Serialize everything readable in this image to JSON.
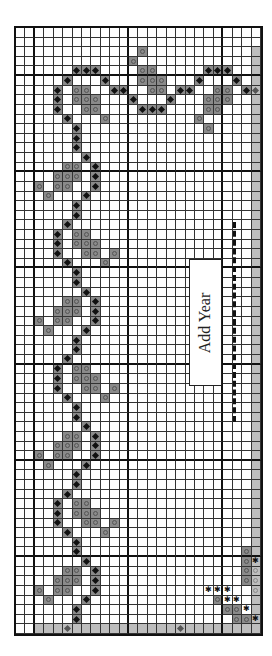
{
  "grid": {
    "cols": 26,
    "rows": 63,
    "thick_col_every": 10,
    "thick_col_offset": 2,
    "thick_row_every": 10,
    "thick_row_offset": 5
  },
  "colors": {
    "mark": "#8a8a8a",
    "shade": "#bdbdbd",
    "line": "#333333"
  },
  "shaded": {
    "right_col": 25,
    "right_from_row": 2,
    "bottom_row": 62,
    "bottom_from_col": 2
  },
  "label": {
    "text": "Add Year"
  },
  "marks": [
    [
      2,
      13,
      "O"
    ],
    [
      3,
      12,
      "O"
    ],
    [
      4,
      6,
      "D"
    ],
    [
      4,
      7,
      "D"
    ],
    [
      4,
      8,
      "D"
    ],
    [
      4,
      13,
      "O"
    ],
    [
      4,
      14,
      "O"
    ],
    [
      4,
      20,
      "D"
    ],
    [
      4,
      21,
      "D"
    ],
    [
      4,
      22,
      "D"
    ],
    [
      5,
      5,
      "D"
    ],
    [
      5,
      9,
      "D"
    ],
    [
      5,
      13,
      "O"
    ],
    [
      5,
      14,
      "O"
    ],
    [
      5,
      15,
      "O"
    ],
    [
      5,
      19,
      "D"
    ],
    [
      5,
      23,
      "D"
    ],
    [
      6,
      4,
      "D"
    ],
    [
      6,
      6,
      "O"
    ],
    [
      6,
      7,
      "O"
    ],
    [
      6,
      10,
      "D"
    ],
    [
      6,
      11,
      "D"
    ],
    [
      6,
      14,
      "O"
    ],
    [
      6,
      15,
      "O"
    ],
    [
      6,
      17,
      "D"
    ],
    [
      6,
      18,
      "D"
    ],
    [
      6,
      21,
      "O"
    ],
    [
      6,
      22,
      "O"
    ],
    [
      6,
      24,
      "D"
    ],
    [
      6,
      25,
      "d"
    ],
    [
      7,
      4,
      "D"
    ],
    [
      7,
      6,
      "O"
    ],
    [
      7,
      7,
      "O"
    ],
    [
      7,
      8,
      "O"
    ],
    [
      7,
      12,
      "D"
    ],
    [
      7,
      16,
      "D"
    ],
    [
      7,
      20,
      "O"
    ],
    [
      7,
      21,
      "O"
    ],
    [
      7,
      22,
      "O"
    ],
    [
      8,
      4,
      "D"
    ],
    [
      8,
      7,
      "O"
    ],
    [
      8,
      8,
      "O"
    ],
    [
      8,
      13,
      "D"
    ],
    [
      8,
      14,
      "D"
    ],
    [
      8,
      15,
      "D"
    ],
    [
      8,
      20,
      "O"
    ],
    [
      8,
      21,
      "O"
    ],
    [
      9,
      5,
      "D"
    ],
    [
      9,
      9,
      "O"
    ],
    [
      9,
      19,
      "O"
    ],
    [
      10,
      6,
      "D"
    ],
    [
      10,
      20,
      "O"
    ],
    [
      11,
      6,
      "D"
    ],
    [
      12,
      6,
      "D"
    ],
    [
      13,
      7,
      "D"
    ],
    [
      14,
      5,
      "O"
    ],
    [
      14,
      6,
      "O"
    ],
    [
      14,
      8,
      "D"
    ],
    [
      15,
      4,
      "O"
    ],
    [
      15,
      5,
      "O"
    ],
    [
      15,
      6,
      "O"
    ],
    [
      15,
      8,
      "D"
    ],
    [
      16,
      2,
      "O"
    ],
    [
      16,
      4,
      "O"
    ],
    [
      16,
      5,
      "O"
    ],
    [
      16,
      8,
      "D"
    ],
    [
      17,
      3,
      "O"
    ],
    [
      17,
      7,
      "D"
    ],
    [
      18,
      6,
      "D"
    ],
    [
      19,
      6,
      "D"
    ],
    [
      20,
      5,
      "D"
    ],
    [
      21,
      4,
      "D"
    ],
    [
      21,
      6,
      "O"
    ],
    [
      21,
      7,
      "O"
    ],
    [
      22,
      4,
      "D"
    ],
    [
      22,
      6,
      "O"
    ],
    [
      22,
      7,
      "O"
    ],
    [
      22,
      8,
      "O"
    ],
    [
      23,
      4,
      "D"
    ],
    [
      23,
      7,
      "O"
    ],
    [
      23,
      8,
      "O"
    ],
    [
      23,
      10,
      "O"
    ],
    [
      24,
      5,
      "D"
    ],
    [
      24,
      9,
      "O"
    ],
    [
      25,
      6,
      "D"
    ],
    [
      26,
      6,
      "D"
    ],
    [
      27,
      7,
      "D"
    ],
    [
      28,
      5,
      "O"
    ],
    [
      28,
      6,
      "O"
    ],
    [
      28,
      8,
      "D"
    ],
    [
      29,
      4,
      "O"
    ],
    [
      29,
      5,
      "O"
    ],
    [
      29,
      6,
      "O"
    ],
    [
      29,
      8,
      "D"
    ],
    [
      30,
      2,
      "O"
    ],
    [
      30,
      4,
      "O"
    ],
    [
      30,
      5,
      "O"
    ],
    [
      30,
      8,
      "D"
    ],
    [
      31,
      3,
      "O"
    ],
    [
      31,
      7,
      "D"
    ],
    [
      32,
      6,
      "D"
    ],
    [
      33,
      6,
      "D"
    ],
    [
      34,
      5,
      "D"
    ],
    [
      35,
      4,
      "D"
    ],
    [
      35,
      6,
      "O"
    ],
    [
      35,
      7,
      "O"
    ],
    [
      36,
      4,
      "D"
    ],
    [
      36,
      6,
      "O"
    ],
    [
      36,
      7,
      "O"
    ],
    [
      36,
      8,
      "O"
    ],
    [
      37,
      4,
      "D"
    ],
    [
      37,
      7,
      "O"
    ],
    [
      37,
      8,
      "O"
    ],
    [
      37,
      10,
      "O"
    ],
    [
      38,
      5,
      "D"
    ],
    [
      38,
      9,
      "O"
    ],
    [
      39,
      6,
      "D"
    ],
    [
      40,
      6,
      "D"
    ],
    [
      41,
      7,
      "D"
    ],
    [
      42,
      5,
      "O"
    ],
    [
      42,
      6,
      "O"
    ],
    [
      42,
      8,
      "D"
    ],
    [
      43,
      4,
      "O"
    ],
    [
      43,
      5,
      "O"
    ],
    [
      43,
      6,
      "O"
    ],
    [
      43,
      8,
      "D"
    ],
    [
      44,
      2,
      "O"
    ],
    [
      44,
      4,
      "O"
    ],
    [
      44,
      5,
      "O"
    ],
    [
      44,
      8,
      "D"
    ],
    [
      45,
      3,
      "O"
    ],
    [
      45,
      7,
      "D"
    ],
    [
      46,
      6,
      "D"
    ],
    [
      47,
      6,
      "D"
    ],
    [
      48,
      5,
      "D"
    ],
    [
      49,
      4,
      "D"
    ],
    [
      49,
      6,
      "O"
    ],
    [
      49,
      7,
      "O"
    ],
    [
      50,
      4,
      "D"
    ],
    [
      50,
      6,
      "O"
    ],
    [
      50,
      7,
      "O"
    ],
    [
      50,
      8,
      "O"
    ],
    [
      51,
      4,
      "D"
    ],
    [
      51,
      7,
      "O"
    ],
    [
      51,
      8,
      "O"
    ],
    [
      51,
      10,
      "O"
    ],
    [
      52,
      5,
      "D"
    ],
    [
      52,
      9,
      "O"
    ],
    [
      53,
      6,
      "D"
    ],
    [
      54,
      6,
      "D"
    ],
    [
      54,
      24,
      "O"
    ],
    [
      55,
      7,
      "D"
    ],
    [
      55,
      24,
      "O"
    ],
    [
      55,
      25,
      "s"
    ],
    [
      56,
      5,
      "O"
    ],
    [
      56,
      6,
      "O"
    ],
    [
      56,
      8,
      "D"
    ],
    [
      56,
      24,
      "O"
    ],
    [
      56,
      25,
      "o"
    ],
    [
      57,
      4,
      "O"
    ],
    [
      57,
      5,
      "O"
    ],
    [
      57,
      6,
      "O"
    ],
    [
      57,
      8,
      "D"
    ],
    [
      57,
      24,
      "O"
    ],
    [
      57,
      25,
      "o"
    ],
    [
      58,
      2,
      "O"
    ],
    [
      58,
      4,
      "O"
    ],
    [
      58,
      5,
      "O"
    ],
    [
      58,
      8,
      "D"
    ],
    [
      58,
      20,
      "S"
    ],
    [
      58,
      21,
      "S"
    ],
    [
      58,
      22,
      "S"
    ],
    [
      58,
      25,
      "o"
    ],
    [
      59,
      3,
      "O"
    ],
    [
      59,
      7,
      "D"
    ],
    [
      59,
      21,
      "O"
    ],
    [
      59,
      22,
      "S"
    ],
    [
      59,
      23,
      "S"
    ],
    [
      60,
      6,
      "D"
    ],
    [
      60,
      22,
      "O"
    ],
    [
      60,
      23,
      "O"
    ],
    [
      60,
      24,
      "S"
    ],
    [
      61,
      6,
      "D"
    ],
    [
      61,
      23,
      "O"
    ],
    [
      61,
      24,
      "O"
    ],
    [
      61,
      25,
      "s"
    ],
    [
      62,
      5,
      "d"
    ],
    [
      62,
      17,
      "d"
    ]
  ]
}
